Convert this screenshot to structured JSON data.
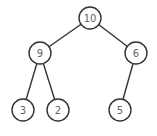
{
  "diagram": {
    "type": "binary-tree",
    "nodes": [
      {
        "id": "n10",
        "label": "10",
        "x": 90,
        "y": 18
      },
      {
        "id": "n9",
        "label": "9",
        "x": 40,
        "y": 53
      },
      {
        "id": "n6",
        "label": "6",
        "x": 136,
        "y": 53
      },
      {
        "id": "n3",
        "label": "3",
        "x": 23,
        "y": 110
      },
      {
        "id": "n2",
        "label": "2",
        "x": 58,
        "y": 110
      },
      {
        "id": "n5",
        "label": "5",
        "x": 120,
        "y": 110
      }
    ],
    "edges": [
      {
        "from": "n10",
        "to": "n9"
      },
      {
        "from": "n10",
        "to": "n6"
      },
      {
        "from": "n9",
        "to": "n3"
      },
      {
        "from": "n9",
        "to": "n2"
      },
      {
        "from": "n6",
        "to": "n5"
      }
    ]
  }
}
